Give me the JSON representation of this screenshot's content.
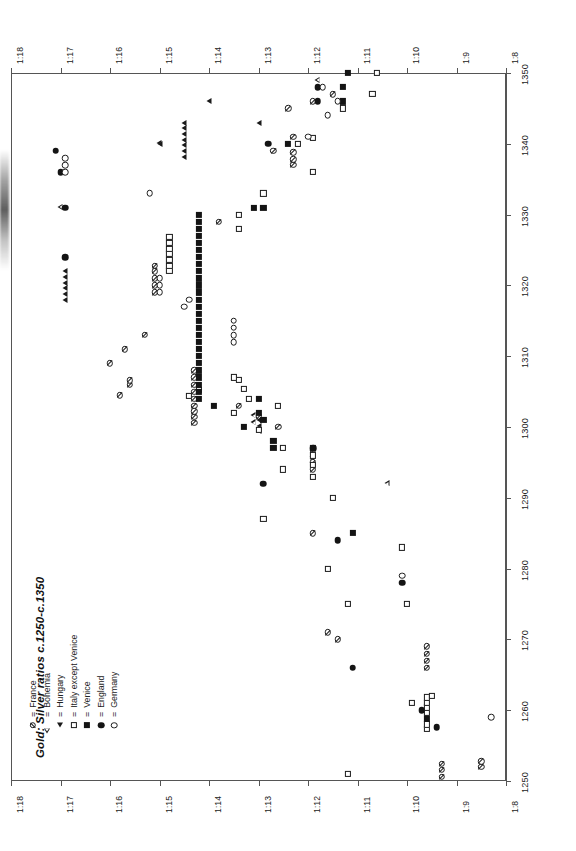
{
  "figure": {
    "title": "Gold: Silver ratios c.1250-c.1350",
    "equals_sign": "=",
    "frame_color": "#555555",
    "marker_color": "#1a1a1a"
  },
  "legend": {
    "entries": [
      {
        "symbol": "circle-slash",
        "label": "France",
        "key": "france"
      },
      {
        "symbol": "open-triangle",
        "label": "Bohemia",
        "key": "bohemia"
      },
      {
        "symbol": "filled-triangle",
        "label": "Hungary",
        "key": "hungary"
      },
      {
        "symbol": "open-square",
        "label": "Italy except Venice",
        "key": "italy"
      },
      {
        "symbol": "filled-square",
        "label": "Venice",
        "key": "venice"
      },
      {
        "symbol": "filled-circle",
        "label": "England",
        "key": "england"
      },
      {
        "symbol": "open-circle",
        "label": "Germany",
        "key": "germany"
      }
    ]
  },
  "chart_data": {
    "type": "scatter",
    "title": "Gold: Silver ratios c.1250-c.1350",
    "orientation": "rotated-90-clockwise",
    "xlabel": "",
    "ylabel": "",
    "grid": false,
    "legend_position": "bottom-left",
    "x_axis": {
      "name": "year",
      "range": [
        1250,
        1350
      ],
      "ticks": [
        1250,
        1260,
        1270,
        1280,
        1290,
        1300,
        1310,
        1320,
        1330,
        1340,
        1350
      ],
      "tick_labels": [
        "1250",
        "1260",
        "1270",
        "1280",
        "1290",
        "1300",
        "1310",
        "1320",
        "1330",
        "1340",
        "1350"
      ],
      "rendered_on": "right-edge"
    },
    "y_axis": {
      "name": "gold_silver_ratio",
      "range": [
        18,
        8
      ],
      "ticks": [
        18,
        17,
        16,
        15,
        14,
        13,
        12,
        11,
        10,
        9,
        8
      ],
      "tick_labels": [
        "1:18",
        "1:17",
        "1:16",
        "1:15",
        "1:14",
        "1:13",
        "1:12",
        "1:11",
        "1:10",
        "1:9",
        "1:8"
      ],
      "rendered_on": "top-and-bottom"
    },
    "series": [
      {
        "name": "France",
        "key": "france",
        "symbol": "circle-slash",
        "points": [
          [
            1252,
            8.5
          ],
          [
            1252.8,
            8.5
          ],
          [
            1250.6,
            9.3
          ],
          [
            1251.6,
            9.3
          ],
          [
            1252.4,
            9.3
          ],
          [
            1266,
            9.6
          ],
          [
            1267,
            9.6
          ],
          [
            1268,
            9.6
          ],
          [
            1269,
            9.6
          ],
          [
            1270,
            11.4
          ],
          [
            1271,
            11.6
          ],
          [
            1285,
            11.9
          ],
          [
            1294,
            11.9
          ],
          [
            1295,
            11.9
          ],
          [
            1295.8,
            11.9
          ],
          [
            1296.6,
            11.9
          ],
          [
            1300,
            12.6
          ],
          [
            1301.5,
            13.0
          ],
          [
            1303,
            13.4
          ],
          [
            1304,
            14.3
          ],
          [
            1305,
            14.3
          ],
          [
            1306,
            14.3
          ],
          [
            1307,
            14.3
          ],
          [
            1308,
            14.3
          ],
          [
            1300.6,
            14.3
          ],
          [
            1301.4,
            14.3
          ],
          [
            1302.2,
            14.3
          ],
          [
            1303,
            14.3
          ],
          [
            1304.5,
            15.8
          ],
          [
            1306,
            15.6
          ],
          [
            1306.6,
            15.6
          ],
          [
            1309,
            16.0
          ],
          [
            1311,
            15.7
          ],
          [
            1313,
            15.3
          ],
          [
            1319,
            15.1
          ],
          [
            1320,
            15.1
          ],
          [
            1321,
            15.1
          ],
          [
            1322,
            15.1
          ],
          [
            1322.8,
            15.1
          ],
          [
            1329,
            13.8
          ],
          [
            1337,
            12.3
          ],
          [
            1337.8,
            12.3
          ],
          [
            1338.8,
            12.3
          ],
          [
            1339,
            12.7
          ],
          [
            1341,
            12.3
          ],
          [
            1345,
            12.4
          ],
          [
            1346,
            11.9
          ],
          [
            1347,
            11.5
          ]
        ]
      },
      {
        "name": "Bohemia",
        "key": "bohemia",
        "symbol": "open-triangle",
        "points": [
          [
            1292,
            10.3
          ],
          [
            1300.6,
            13.0
          ],
          [
            1301.6,
            13.0
          ],
          [
            1331,
            16.9
          ],
          [
            1340,
            14.9
          ],
          [
            1349,
            11.7
          ]
        ]
      },
      {
        "name": "Hungary",
        "key": "hungary",
        "symbol": "filled-triangle",
        "points": [
          [
            1299.4,
            13.0
          ],
          [
            1300.2,
            13.0
          ],
          [
            1301,
            13.0
          ],
          [
            1311,
            14.2
          ],
          [
            1318,
            16.9
          ],
          [
            1318.8,
            16.9
          ],
          [
            1319.6,
            16.9
          ],
          [
            1320.4,
            16.9
          ],
          [
            1321.2,
            16.9
          ],
          [
            1322,
            16.9
          ],
          [
            1338.2,
            14.5
          ],
          [
            1339,
            14.5
          ],
          [
            1339.8,
            14.5
          ],
          [
            1340.6,
            14.5
          ],
          [
            1341.4,
            14.5
          ],
          [
            1342.2,
            14.5
          ],
          [
            1343,
            14.5
          ],
          [
            1340,
            15.0
          ],
          [
            1343,
            13.0
          ],
          [
            1346,
            14.0
          ]
        ]
      },
      {
        "name": "Italy except Venice",
        "key": "italy",
        "symbol": "open-square",
        "points": [
          [
            1251,
            11.2
          ],
          [
            1257.4,
            9.6
          ],
          [
            1258,
            9.6
          ],
          [
            1259.6,
            9.6
          ],
          [
            1260.4,
            9.6
          ],
          [
            1261,
            9.6
          ],
          [
            1261.8,
            9.6
          ],
          [
            1262,
            9.5
          ],
          [
            1261,
            9.9
          ],
          [
            1275,
            10.0
          ],
          [
            1275,
            11.2
          ],
          [
            1280,
            11.6
          ],
          [
            1283,
            10.1
          ],
          [
            1287,
            12.9
          ],
          [
            1290,
            11.5
          ],
          [
            1293,
            11.9
          ],
          [
            1294.6,
            11.9
          ],
          [
            1296,
            11.9
          ],
          [
            1297,
            11.9
          ],
          [
            1294,
            12.5
          ],
          [
            1297,
            12.5
          ],
          [
            1299.6,
            13.0
          ],
          [
            1302,
            13.5
          ],
          [
            1303,
            12.6
          ],
          [
            1304,
            13.2
          ],
          [
            1305.4,
            13.3
          ],
          [
            1306.6,
            13.4
          ],
          [
            1304.4,
            14.4
          ],
          [
            1305.2,
            14.2
          ],
          [
            1307,
            13.5
          ],
          [
            1322,
            14.8
          ],
          [
            1322.8,
            14.8
          ],
          [
            1323.6,
            14.8
          ],
          [
            1324.4,
            14.8
          ],
          [
            1325.2,
            14.8
          ],
          [
            1326,
            14.8
          ],
          [
            1326.8,
            14.8
          ],
          [
            1328,
            13.4
          ],
          [
            1330,
            13.4
          ],
          [
            1333,
            12.9
          ],
          [
            1336,
            11.9
          ],
          [
            1340,
            12.2
          ],
          [
            1340.8,
            11.9
          ],
          [
            1345,
            11.3
          ],
          [
            1347,
            10.7
          ],
          [
            1350,
            10.6
          ]
        ]
      },
      {
        "name": "Venice",
        "key": "venice",
        "symbol": "filled-square",
        "points": [
          [
            1304,
            14.2
          ],
          [
            1305,
            14.2
          ],
          [
            1306,
            14.2
          ],
          [
            1307,
            14.2
          ],
          [
            1308,
            14.2
          ],
          [
            1309,
            14.2
          ],
          [
            1310,
            14.2
          ],
          [
            1311,
            14.2
          ],
          [
            1312,
            14.2
          ],
          [
            1313,
            14.2
          ],
          [
            1314,
            14.2
          ],
          [
            1315,
            14.2
          ],
          [
            1316,
            14.2
          ],
          [
            1317,
            14.2
          ],
          [
            1318,
            14.2
          ],
          [
            1319,
            14.2
          ],
          [
            1320,
            14.2
          ],
          [
            1321,
            14.2
          ],
          [
            1322,
            14.2
          ],
          [
            1323,
            14.2
          ],
          [
            1324,
            14.2
          ],
          [
            1325,
            14.2
          ],
          [
            1326,
            14.2
          ],
          [
            1327,
            14.2
          ],
          [
            1328,
            14.2
          ],
          [
            1329,
            14.2
          ],
          [
            1330,
            14.2
          ],
          [
            1303,
            13.9
          ],
          [
            1302,
            13.0
          ],
          [
            1301,
            12.9
          ],
          [
            1300,
            13.3
          ],
          [
            1298,
            12.7
          ],
          [
            1297,
            12.7
          ],
          [
            1331,
            13.1
          ],
          [
            1331,
            12.9
          ],
          [
            1340,
            12.4
          ],
          [
            1346,
            11.3
          ],
          [
            1348,
            11.3
          ],
          [
            1350,
            11.2
          ],
          [
            1285,
            11.1
          ],
          [
            1258.8,
            9.6
          ],
          [
            1304,
            13.0
          ]
        ]
      },
      {
        "name": "England",
        "key": "england",
        "symbol": "filled-circle",
        "points": [
          [
            1257.6,
            9.4
          ],
          [
            1260,
            9.7
          ],
          [
            1266,
            11.1
          ],
          [
            1278,
            10.1
          ],
          [
            1284,
            11.4
          ],
          [
            1292,
            12.9
          ],
          [
            1297,
            11.9
          ],
          [
            1324,
            16.9
          ],
          [
            1331,
            16.9
          ],
          [
            1336,
            17.0
          ],
          [
            1339,
            17.1
          ],
          [
            1340,
            12.8
          ],
          [
            1346,
            11.8
          ],
          [
            1348,
            11.8
          ]
        ]
      },
      {
        "name": "Germany",
        "key": "germany",
        "symbol": "open-circle",
        "points": [
          [
            1259,
            8.3
          ],
          [
            1279,
            10.1
          ],
          [
            1312,
            13.5
          ],
          [
            1313,
            13.5
          ],
          [
            1314,
            13.5
          ],
          [
            1315,
            13.5
          ],
          [
            1317,
            14.5
          ],
          [
            1318,
            14.4
          ],
          [
            1319,
            15.0
          ],
          [
            1320,
            15.0
          ],
          [
            1321,
            15.0
          ],
          [
            1333,
            15.2
          ],
          [
            1336,
            16.9
          ],
          [
            1337,
            16.9
          ],
          [
            1338,
            16.9
          ],
          [
            1341,
            12.0
          ],
          [
            1344,
            11.6
          ],
          [
            1346,
            11.4
          ],
          [
            1348,
            11.7
          ]
        ]
      }
    ]
  }
}
